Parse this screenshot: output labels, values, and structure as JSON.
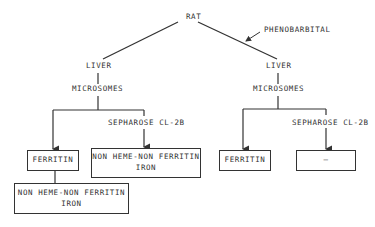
{
  "diagram": {
    "root": "RAT",
    "treatment_label": "PHENOBARBITAL",
    "left_branch": {
      "organ": "LIVER",
      "fraction": "MICROSOMES",
      "column_label": "SEPHAROSE CL-2B",
      "ferritin_box": "FERRITIN",
      "column_result_line1": "NON HEME-NON FERRITIN",
      "column_result_line2": "IRON",
      "ferritin_sub_line1": "NON HEME-NON FERRITIN",
      "ferritin_sub_line2": "IRON"
    },
    "right_branch": {
      "organ": "LIVER",
      "fraction": "MICROSOMES",
      "column_label": "SEPHAROSE CL-2B",
      "ferritin_box": "FERRITIN",
      "column_result": "—"
    }
  }
}
